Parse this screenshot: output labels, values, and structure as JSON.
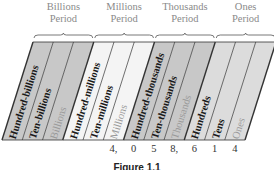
{
  "periods": [
    {
      "name": "Billions",
      "sub": "Period"
    },
    {
      "name": "Millions",
      "sub": "Period"
    },
    {
      "name": "Thousands",
      "sub": "Period"
    },
    {
      "name": "Ones",
      "sub": "Period"
    }
  ],
  "columns": [
    {
      "label": "Hundred-billions",
      "shade": "#c8c8c8",
      "tone": "dark"
    },
    {
      "label": "Ten-billions",
      "shade": "#c8c8c8",
      "tone": "dark"
    },
    {
      "label": "Billions",
      "shade": "#c8c8c8",
      "tone": "light"
    },
    {
      "label": "Hundred-millions",
      "shade": "#f4f4f4",
      "tone": "dark"
    },
    {
      "label": "Ten-millions",
      "shade": "#f4f4f4",
      "tone": "dark"
    },
    {
      "label": "Millions",
      "shade": "#f4f4f4",
      "tone": "light"
    },
    {
      "label": "Hundred-thousands",
      "shade": "#c8c8c8",
      "tone": "dark"
    },
    {
      "label": "Ten-thousands",
      "shade": "#c8c8c8",
      "tone": "dark"
    },
    {
      "label": "Thousands",
      "shade": "#c8c8c8",
      "tone": "light"
    },
    {
      "label": "Hundreds",
      "shade": "#dcdcdc",
      "tone": "dark"
    },
    {
      "label": "Tens",
      "shade": "#dcdcdc",
      "tone": "dark"
    },
    {
      "label": "Ones",
      "shade": "#dcdcdc",
      "tone": "light"
    }
  ],
  "digits": [
    {
      "col": 5,
      "text": "4,"
    },
    {
      "col": 6,
      "text": "0"
    },
    {
      "col": 7,
      "text": "5"
    },
    {
      "col": 8,
      "text": "8,"
    },
    {
      "col": 9,
      "text": "6"
    },
    {
      "col": 10,
      "text": "1"
    },
    {
      "col": 11,
      "text": "4"
    }
  ],
  "caption": "Figure 1.1",
  "colors": {
    "dark_label": "#1a1a1a",
    "light_label": "#9a9a9a",
    "period_label": "#8a8a8a",
    "line": "#333333"
  }
}
